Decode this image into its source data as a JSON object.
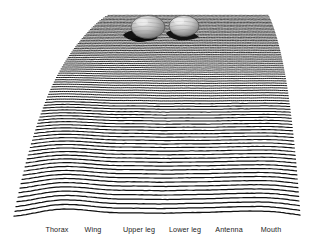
{
  "figure": {
    "title": "",
    "background_color": "#ffffff",
    "line_color": "#111111",
    "label_color": "#1c1c1c"
  },
  "chart_data": {
    "type": "line",
    "title": "",
    "xlabel": "",
    "ylabel": "",
    "grid": false,
    "legend_position": "none",
    "categories": [
      "Thorax",
      "Wing",
      "Upper leg",
      "Lower leg",
      "Antenna",
      "Mouth"
    ],
    "x_tick_positions_px": [
      57,
      93,
      139,
      185,
      229,
      271
    ],
    "peak_centers_px": [
      57,
      93,
      139,
      185,
      229,
      271
    ],
    "values": [
      1.0,
      0.82,
      0.95,
      0.9,
      0.78,
      0.7
    ],
    "n_lines": 78,
    "line_pitch_top_px": 1.9,
    "line_pitch_bottom_px": 6.6,
    "amplitude_top": 0.1,
    "amplitude_bottom": 10.5,
    "field_top_px": 14,
    "field_bottom_px": 220,
    "left_edge_top_px": 108,
    "left_edge_bottom_px": 14,
    "right_edge_top_px": 268,
    "right_edge_bottom_px": 300,
    "annotations": [
      {
        "name": "mound-left",
        "cx": 148,
        "cy": 27,
        "rx": 17,
        "ry": 11
      },
      {
        "name": "mound-right",
        "cx": 184,
        "cy": 26,
        "rx": 15,
        "ry": 10
      }
    ]
  },
  "axis": {
    "labels": [
      {
        "text": "Thorax",
        "x": 57
      },
      {
        "text": "Wing",
        "x": 93
      },
      {
        "text": "Upper leg",
        "x": 139
      },
      {
        "text": "Lower leg",
        "x": 185
      },
      {
        "text": "Antenna",
        "x": 229
      },
      {
        "text": "Mouth",
        "x": 271
      }
    ]
  },
  "objects": {
    "mounds": [
      {
        "name": "mound-left",
        "fill": "#b9b9b9",
        "shadow": "#151515"
      },
      {
        "name": "mound-right",
        "fill": "#c2c2c2",
        "shadow": "#171717"
      }
    ]
  }
}
